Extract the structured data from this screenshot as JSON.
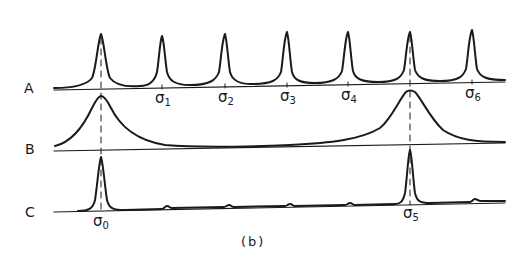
{
  "figure": {
    "caption": "(b)",
    "ink_color": "#1a1a1a",
    "rows": [
      {
        "label": "A",
        "description": "periodic sharp peaks"
      },
      {
        "label": "B",
        "description": "two broad peaks"
      },
      {
        "label": "C",
        "description": "product spectrum with two strong peaks"
      }
    ],
    "row_a_markers": [
      {
        "symbol": "σ",
        "sub": "1"
      },
      {
        "symbol": "σ",
        "sub": "2"
      },
      {
        "symbol": "σ",
        "sub": "3"
      },
      {
        "symbol": "σ",
        "sub": "4"
      },
      {
        "symbol": "σ",
        "sub": "6"
      }
    ],
    "row_c_markers": [
      {
        "symbol": "σ",
        "sub": "0"
      },
      {
        "symbol": "σ",
        "sub": "5"
      }
    ]
  }
}
